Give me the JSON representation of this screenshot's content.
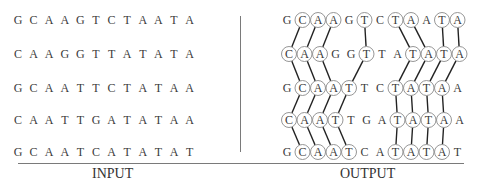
{
  "input": {
    "caption": "INPUT",
    "sequences": [
      "GCAAGTCTAATA",
      "CAAGGTTATATA",
      "GCAATTCTATAA",
      "CAATTGATATAA",
      "GCAATCATATAT"
    ]
  },
  "output": {
    "caption": "OUTPUT",
    "sequences": [
      {
        "seq": "GCAAGTCTAATA",
        "circled": [
          1,
          2,
          3,
          5,
          7,
          8,
          10,
          11
        ]
      },
      {
        "seq": "CAAGGTTATATA",
        "circled": [
          0,
          1,
          2,
          5,
          8,
          9,
          10,
          11
        ]
      },
      {
        "seq": "GCAATTCTATAA",
        "circled": [
          1,
          2,
          3,
          4,
          7,
          8,
          9,
          10
        ]
      },
      {
        "seq": "CAATTGATATAA",
        "circled": [
          0,
          1,
          2,
          3,
          7,
          8,
          9,
          10
        ]
      },
      {
        "seq": "GCAATCATATAT",
        "circled": [
          1,
          2,
          3,
          4,
          7,
          8,
          9,
          10
        ]
      }
    ],
    "links": [
      [
        [
          0,
          1
        ],
        [
          1,
          0
        ]
      ],
      [
        [
          0,
          2
        ],
        [
          1,
          1
        ]
      ],
      [
        [
          0,
          3
        ],
        [
          1,
          2
        ]
      ],
      [
        [
          0,
          5
        ],
        [
          1,
          5
        ]
      ],
      [
        [
          0,
          7
        ],
        [
          1,
          8
        ]
      ],
      [
        [
          0,
          8
        ],
        [
          1,
          9
        ]
      ],
      [
        [
          0,
          10
        ],
        [
          1,
          10
        ]
      ],
      [
        [
          0,
          11
        ],
        [
          1,
          11
        ]
      ],
      [
        [
          1,
          0
        ],
        [
          2,
          1
        ]
      ],
      [
        [
          1,
          1
        ],
        [
          2,
          2
        ]
      ],
      [
        [
          1,
          2
        ],
        [
          2,
          3
        ]
      ],
      [
        [
          1,
          5
        ],
        [
          2,
          4
        ]
      ],
      [
        [
          1,
          8
        ],
        [
          2,
          7
        ]
      ],
      [
        [
          1,
          9
        ],
        [
          2,
          8
        ]
      ],
      [
        [
          1,
          10
        ],
        [
          2,
          9
        ]
      ],
      [
        [
          1,
          11
        ],
        [
          2,
          10
        ]
      ],
      [
        [
          2,
          1
        ],
        [
          3,
          0
        ]
      ],
      [
        [
          2,
          2
        ],
        [
          3,
          1
        ]
      ],
      [
        [
          2,
          3
        ],
        [
          3,
          2
        ]
      ],
      [
        [
          2,
          4
        ],
        [
          3,
          3
        ]
      ],
      [
        [
          2,
          7
        ],
        [
          3,
          7
        ]
      ],
      [
        [
          2,
          8
        ],
        [
          3,
          8
        ]
      ],
      [
        [
          2,
          9
        ],
        [
          3,
          9
        ]
      ],
      [
        [
          2,
          10
        ],
        [
          3,
          10
        ]
      ],
      [
        [
          3,
          0
        ],
        [
          4,
          1
        ]
      ],
      [
        [
          3,
          1
        ],
        [
          4,
          2
        ]
      ],
      [
        [
          3,
          2
        ],
        [
          4,
          3
        ]
      ],
      [
        [
          3,
          3
        ],
        [
          4,
          4
        ]
      ],
      [
        [
          3,
          7
        ],
        [
          4,
          7
        ]
      ],
      [
        [
          3,
          8
        ],
        [
          4,
          8
        ]
      ],
      [
        [
          3,
          9
        ],
        [
          4,
          9
        ]
      ],
      [
        [
          3,
          10
        ],
        [
          4,
          10
        ]
      ]
    ]
  },
  "colors": {
    "text": "#3a3a3a",
    "lines": "#222222",
    "circle": "#8a8a8a",
    "rule": "#7a7a7a"
  }
}
